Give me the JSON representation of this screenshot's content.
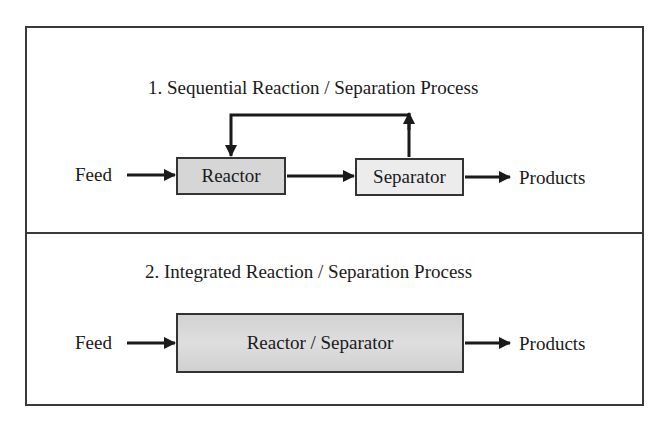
{
  "section1": {
    "title": "1. Sequential Reaction / Separation Process",
    "feed_label": "Feed",
    "reactor_label": "Reactor",
    "separator_label": "Separator",
    "products_label": "Products",
    "recycle": "Recycle stream from Separator back to Reactor"
  },
  "section2": {
    "title": "2. Integrated Reaction / Separation Process",
    "feed_label": "Feed",
    "combined_label": "Reactor / Separator",
    "products_label": "Products"
  },
  "colors": {
    "stroke": "#1a1a1a",
    "reactor_fill": "#d6d6d6",
    "separator_fill": "#ececec",
    "combined_fill": "#d6d6d6"
  }
}
